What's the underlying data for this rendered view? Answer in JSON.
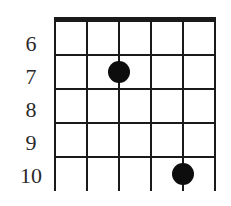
{
  "diagram": {
    "type": "guitar-chord-chart",
    "strings": 6,
    "fret_labels": [
      "6",
      "7",
      "8",
      "9",
      "10"
    ],
    "frets_shown": [
      6,
      7,
      8,
      9,
      10
    ],
    "dots": [
      {
        "string": 3,
        "fret": 7
      },
      {
        "string": 5,
        "fret": 10
      }
    ],
    "colors": {
      "line": "#1a1a1a",
      "dot": "#0d0d0d",
      "label": "#2a2a2a",
      "background": "#ffffff"
    }
  }
}
